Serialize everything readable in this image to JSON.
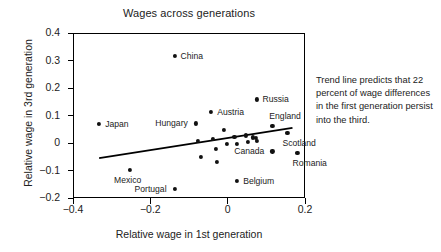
{
  "chart_data": {
    "type": "scatter",
    "title": "Wages across generations",
    "xlabel": "Relative wage in 1st generation",
    "ylabel": "Relative wage in 3rd generation",
    "xlim": [
      -0.4,
      0.2
    ],
    "ylim": [
      -0.2,
      0.4
    ],
    "xticks": [
      "-0.4",
      "-0.2",
      "0",
      "0.2"
    ],
    "xtick_values": [
      -0.4,
      -0.2,
      0,
      0.2
    ],
    "yticks": [
      "0.4",
      "0.3",
      "0.2",
      "0.1",
      "0",
      "-0.1",
      "-0.2"
    ],
    "ytick_values": [
      0.4,
      0.3,
      0.2,
      0.1,
      0,
      -0.1,
      -0.2
    ],
    "grid": false,
    "legend": "none",
    "annotation": "Trend line predicts that 22 percent of wage differences in the first generation persist into the third.",
    "trendline": {
      "x0": -0.335,
      "y0": -0.051,
      "x1": 0.165,
      "y1": 0.059,
      "slope": 0.22
    },
    "points": [
      {
        "label": "Japan",
        "x": -0.335,
        "y": 0.072,
        "label_side": "right"
      },
      {
        "label": "Mexico",
        "x": -0.255,
        "y": -0.095,
        "label_side": "below"
      },
      {
        "label": "China",
        "x": -0.14,
        "y": 0.32,
        "label_side": "right"
      },
      {
        "label": "Portugal",
        "x": -0.14,
        "y": -0.162,
        "label_side": "left"
      },
      {
        "label": "Hungary",
        "x": -0.085,
        "y": 0.075,
        "label_side": "left"
      },
      {
        "label": "Austria",
        "x": -0.045,
        "y": 0.118,
        "label_side": "right"
      },
      {
        "label": "Russia",
        "x": 0.072,
        "y": 0.162,
        "label_side": "right"
      },
      {
        "label": "England",
        "x": 0.113,
        "y": 0.066,
        "label_side": "above-right"
      },
      {
        "label": "Scotland",
        "x": 0.152,
        "y": 0.041,
        "label_side": "below-right"
      },
      {
        "label": "Canada",
        "x": 0.113,
        "y": -0.027,
        "label_side": "left"
      },
      {
        "label": "Romania",
        "x": 0.178,
        "y": -0.031,
        "label_side": "below-right"
      },
      {
        "label": "Belgium",
        "x": 0.022,
        "y": -0.133,
        "label_side": "right"
      },
      {
        "label": "",
        "x": -0.079,
        "y": 0.01,
        "label_side": ""
      },
      {
        "label": "",
        "x": -0.072,
        "y": -0.047,
        "label_side": ""
      },
      {
        "label": "",
        "x": -0.04,
        "y": 0.019,
        "label_side": ""
      },
      {
        "label": "",
        "x": -0.033,
        "y": -0.018,
        "label_side": ""
      },
      {
        "label": "",
        "x": -0.03,
        "y": -0.064,
        "label_side": ""
      },
      {
        "label": "",
        "x": -0.012,
        "y": 0.052,
        "label_side": ""
      },
      {
        "label": "",
        "x": -0.005,
        "y": -0.001,
        "label_side": ""
      },
      {
        "label": "",
        "x": 0.015,
        "y": 0.027,
        "label_side": ""
      },
      {
        "label": "",
        "x": 0.022,
        "y": -0.001,
        "label_side": ""
      },
      {
        "label": "",
        "x": 0.045,
        "y": 0.031,
        "label_side": ""
      },
      {
        "label": "",
        "x": 0.05,
        "y": 0.007,
        "label_side": ""
      },
      {
        "label": "",
        "x": 0.062,
        "y": 0.024,
        "label_side": ""
      },
      {
        "label": "",
        "x": 0.07,
        "y": 0.022,
        "label_side": ""
      },
      {
        "label": "",
        "x": 0.074,
        "y": 0.012,
        "label_side": ""
      }
    ]
  }
}
